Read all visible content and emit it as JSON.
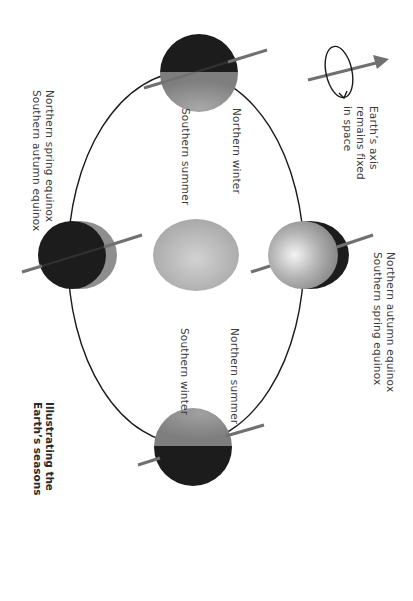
{
  "diagram": {
    "title": {
      "line1": "Illustrating the",
      "line2": "Earth’s seasons"
    },
    "axis_note": {
      "line1": "Earth’s axis",
      "line2": "remains fixed",
      "line3": "in space"
    },
    "positions": {
      "top": {
        "north": "Northern winter",
        "south": "Southern summer"
      },
      "right": {
        "line1": "Northern autumn equinox",
        "line2": "Southern spring equinox"
      },
      "left": {
        "line1": "Northern spring equinox",
        "line2": "Southern autumn equinox"
      },
      "bottom": {
        "north": "Northern summer",
        "south": "Southern winter"
      }
    },
    "center_body": "sun",
    "colors": {
      "background": "#ffffff",
      "night_side": "#1c1c1c",
      "day_side": "#8e8e8e",
      "axis": "#707070",
      "orbit": "#1a1a1a",
      "sun": "#b8b8b8",
      "text": "#3a3a3a"
    }
  }
}
